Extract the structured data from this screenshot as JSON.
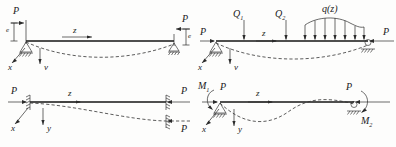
{
  "figure": {
    "axis_labels": {
      "x": "x",
      "y": "y",
      "v": "v",
      "z": "z"
    },
    "colors": {
      "line": "#141414",
      "dashed": "#343434",
      "hatch": "#2b2b2b"
    }
  },
  "panels": [
    {
      "id": "case-1",
      "name": "eccentric-axial-load",
      "labels": {
        "load_left": "P",
        "load_right": "P",
        "eccentricity_left": "e",
        "eccentricity_right": "e",
        "axis_z": "z",
        "axis_x": "x",
        "axis_v": "v"
      },
      "supports": {
        "left": "pin",
        "right": "roller"
      },
      "deflection": "single-sag"
    },
    {
      "id": "case-2",
      "name": "transverse-and-distributed-loads",
      "labels": {
        "load_left": "P",
        "load_right": "P",
        "point_load_1": "Q",
        "point_load_1_sub": "1",
        "point_load_2": "Q",
        "point_load_2_sub": "2",
        "distributed_load": "q(z)",
        "axis_z": "z",
        "axis_x": "x",
        "axis_v": "v"
      },
      "supports": {
        "left": "pin",
        "right": "roller"
      },
      "deflection": "single-sag",
      "distributed_arrow_count": 7
    },
    {
      "id": "case-3",
      "name": "sliding-fixed-ends",
      "labels": {
        "load_left": "P",
        "load_right_upper": "P",
        "load_right_lower": "P",
        "axis_z": "z",
        "axis_x": "x",
        "axis_y": "y"
      },
      "supports": {
        "left": "sliding-wall",
        "right": "sliding-wall"
      },
      "deflection": "half-sag"
    },
    {
      "id": "case-4",
      "name": "end-moments",
      "labels": {
        "moment_left": "M",
        "moment_left_sub": "1",
        "moment_right": "M",
        "moment_right_sub": "2",
        "load_left": "P",
        "load_right": "P",
        "axis_z": "z",
        "axis_x": "x",
        "axis_y": "y"
      },
      "supports": {
        "left": "pin",
        "right": "roller"
      },
      "deflection": "s-curve"
    }
  ]
}
